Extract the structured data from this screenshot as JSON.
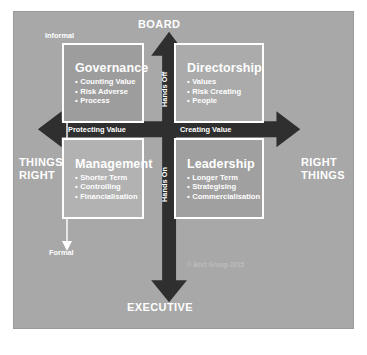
{
  "diagram": {
    "title_internal": "Governance / Directorship / Management / Leadership matrix",
    "background_color": "#a8a8a8",
    "text_color": "#ffffff",
    "arrow_color": "#2f2f2f",
    "poles": {
      "top": "BOARD",
      "bottom": "EXECUTIVE",
      "left_line1": "THINGS",
      "left_line2": "RIGHT",
      "right_line1": "RIGHT",
      "right_line2": "THINGS"
    },
    "horizontal_axis": {
      "left_band": "Protecting Value",
      "right_band": "Creating Value"
    },
    "vertical_axis": {
      "upper_band": "Hands Off",
      "lower_band": "Hands On"
    },
    "scale": {
      "top": "Informal",
      "bottom": "Formal"
    },
    "quadrants": [
      {
        "key": "governance",
        "title": "Governance",
        "bullets": [
          "Counting Value",
          "Risk Adverse",
          "Process"
        ],
        "fill": "#9d9d9d"
      },
      {
        "key": "directorship",
        "title": "Directorship",
        "bullets": [
          "Values",
          "Risk Creating",
          "People"
        ],
        "fill": "#ababab"
      },
      {
        "key": "management",
        "title": "Management",
        "bullets": [
          "Shorter Term",
          "Controlling",
          "Financialisation"
        ],
        "fill": "#b2b2b2"
      },
      {
        "key": "leadership",
        "title": "Leadership",
        "bullets": [
          "Longer Term",
          "Strategising",
          "Commercialisation"
        ],
        "fill": "#a0a0a0"
      }
    ],
    "copyright": "© Bret Group 2015"
  }
}
